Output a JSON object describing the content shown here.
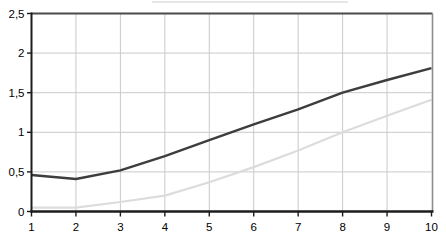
{
  "chart_data": {
    "type": "line",
    "title": "",
    "xlabel": "",
    "ylabel": "",
    "x": [
      1,
      2,
      3,
      4,
      5,
      6,
      7,
      8,
      9,
      10
    ],
    "series": [
      {
        "name": "series-dark",
        "color": "#3d3d3d",
        "width": 2.4,
        "values": [
          0.46,
          0.41,
          0.52,
          0.7,
          0.9,
          1.1,
          1.29,
          1.5,
          1.66,
          1.81
        ]
      },
      {
        "name": "series-light",
        "color": "#dcdcdc",
        "width": 2.2,
        "values": [
          0.05,
          0.05,
          0.12,
          0.2,
          0.37,
          0.56,
          0.77,
          1.0,
          1.21,
          1.41
        ]
      }
    ],
    "xlim": [
      1,
      10
    ],
    "ylim": [
      0,
      2.5
    ],
    "x_tick_labels": [
      "1",
      "2",
      "3",
      "4",
      "5",
      "6",
      "7",
      "8",
      "9",
      "10"
    ],
    "x_tick_values": [
      1,
      2,
      3,
      4,
      5,
      6,
      7,
      8,
      9,
      10
    ],
    "y_tick_labels": [
      "0",
      "0,5",
      "1",
      "1,5",
      "2",
      "2,5"
    ],
    "y_tick_values": [
      0,
      0.5,
      1,
      1.5,
      2,
      2.5
    ],
    "grid": true,
    "legend": "none",
    "colors": {
      "background": "#ffffff",
      "grid": "#c9c9c9",
      "axis": "#1c1c1c",
      "top_border": "#4a4a4a",
      "right_border": "#8c8c8c",
      "tick_label": "#000000"
    }
  }
}
